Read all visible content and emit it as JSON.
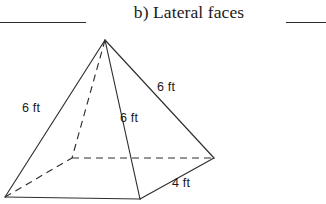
{
  "header": {
    "rule_left": "",
    "title": "b) Lateral faces",
    "rule_right": ""
  },
  "figure": {
    "shape_name": "square-pyramid",
    "stroke_color": "#2e2e2e",
    "background_color": "#ffffff",
    "labels": [
      {
        "id": "left-slant-edge",
        "text": "6 ft",
        "x": 22,
        "y": 84
      },
      {
        "id": "right-slant-edge",
        "text": "6 ft",
        "x": 157,
        "y": 63
      },
      {
        "id": "front-slant-edge",
        "text": "6 ft",
        "x": 120,
        "y": 94
      },
      {
        "id": "base-edge",
        "text": "4 ft",
        "x": 172,
        "y": 159
      }
    ],
    "vertices": {
      "apex": {
        "x": 105,
        "y": 12
      },
      "left": {
        "x": 5,
        "y": 169
      },
      "front": {
        "x": 140,
        "y": 171
      },
      "right": {
        "x": 214,
        "y": 130
      },
      "back_hidden": {
        "x": 72,
        "y": 130
      }
    }
  }
}
